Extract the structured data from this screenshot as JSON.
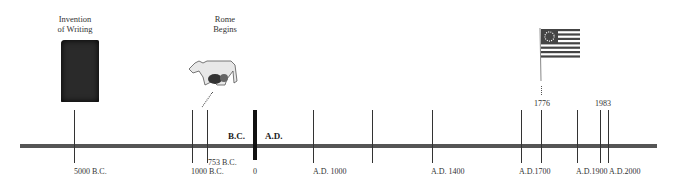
{
  "events": {
    "writing": {
      "label_line1": "Invention",
      "label_line2": "of Writing"
    },
    "rome": {
      "label_line1": "Rome",
      "label_line2": "Begins",
      "date": "753 B.C."
    },
    "independence": {
      "date": "1776"
    },
    "present": {
      "date": "1983"
    }
  },
  "eras": {
    "bc": "B.C.",
    "ad": "A.D."
  },
  "ticks": {
    "t5000bc": "5000  B.C.",
    "t1000bc": "1000  B.C.",
    "t0": "0",
    "t1000ad": "A.D.  1000",
    "t1400ad": "A.D.  1400",
    "t1700ad": "A.D.1700",
    "t1900ad": "A.D.1900",
    "t2000ad": "A.D.2000"
  },
  "colors": {
    "axis": "#555555",
    "text": "#333333",
    "flag_red": "#555555"
  }
}
